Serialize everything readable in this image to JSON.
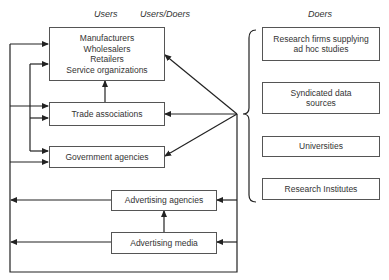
{
  "headers": {
    "users": "Users",
    "users_doers": "Users/Doers",
    "doers": "Doers"
  },
  "users_boxes": {
    "industry": {
      "lines": [
        "Manufacturers",
        "Wholesalers",
        "Retailers",
        "Service organizations"
      ]
    },
    "trade": {
      "label": "Trade associations"
    },
    "government": {
      "label": "Government agencies"
    },
    "ad_agencies": {
      "label": "Advertising agencies"
    },
    "ad_media": {
      "label": "Advertising media"
    }
  },
  "doers_boxes": {
    "research_firms": {
      "lines": [
        "Research firms supplying",
        "ad hoc studies"
      ]
    },
    "syndicated": {
      "lines": [
        "Syndicated data",
        "sources"
      ]
    },
    "universities": {
      "label": "Universities"
    },
    "institutes": {
      "label": "Research Institutes"
    }
  },
  "colors": {
    "line": "#222222",
    "box_border": "#555555",
    "text": "#333333"
  }
}
